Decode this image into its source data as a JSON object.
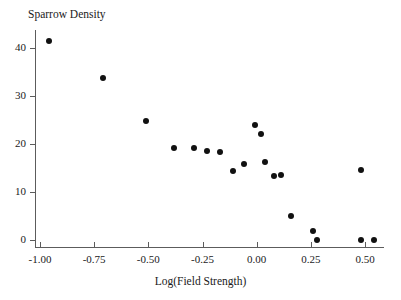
{
  "chart_data": {
    "type": "scatter",
    "title": "",
    "ylabel": "Sparrow Density",
    "xlabel": "Log(Field Strength)",
    "xlim": [
      -1.08,
      0.6
    ],
    "ylim": [
      -1,
      45
    ],
    "grid": false,
    "legend": null,
    "xticks": [
      -1.0,
      -0.75,
      -0.5,
      -0.25,
      0.0,
      0.25,
      0.5
    ],
    "xtick_labels": [
      "-1.00",
      "-0.75",
      "-0.50",
      "-0.25",
      "0.00",
      "0.25",
      "0.50"
    ],
    "yticks": [
      0,
      10,
      20,
      30,
      40
    ],
    "ytick_labels": [
      "0",
      "10",
      "20",
      "30",
      "40"
    ],
    "marker": "filled-circle",
    "marker_color": "#111111",
    "axis_color": "#5c5c5c",
    "points": [
      {
        "x": -0.96,
        "y": 41.5
      },
      {
        "x": -0.71,
        "y": 33.7
      },
      {
        "x": -0.51,
        "y": 24.8
      },
      {
        "x": -0.38,
        "y": 19.2
      },
      {
        "x": -0.29,
        "y": 19.2
      },
      {
        "x": -0.23,
        "y": 18.5
      },
      {
        "x": -0.17,
        "y": 18.3
      },
      {
        "x": -0.11,
        "y": 14.4
      },
      {
        "x": -0.06,
        "y": 15.8
      },
      {
        "x": -0.01,
        "y": 23.9
      },
      {
        "x": 0.02,
        "y": 22.0
      },
      {
        "x": 0.04,
        "y": 16.3
      },
      {
        "x": 0.08,
        "y": 13.3
      },
      {
        "x": 0.11,
        "y": 13.5
      },
      {
        "x": 0.16,
        "y": 4.9
      },
      {
        "x": 0.26,
        "y": 1.8
      },
      {
        "x": 0.28,
        "y": 0.0
      },
      {
        "x": 0.48,
        "y": 14.6
      },
      {
        "x": 0.48,
        "y": 0.0
      },
      {
        "x": 0.54,
        "y": 0.0
      }
    ]
  }
}
